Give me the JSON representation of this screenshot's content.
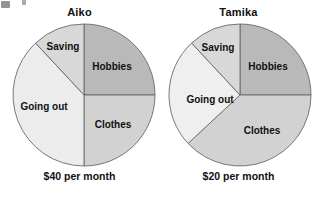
{
  "figure": {
    "title": "",
    "background_color": "#ffffff",
    "text_color": "#111111"
  },
  "charts": [
    {
      "id": "aiko",
      "title": "Aiko",
      "caption": "$40 per month",
      "center": {
        "x": 84,
        "y": 95
      },
      "radius": 71,
      "slices": [
        {
          "label": "Hobbies",
          "percent": 25,
          "color": "#b9b9b9",
          "start_deg": 0,
          "end_deg": 90,
          "label_x": 112,
          "label_y": 67
        },
        {
          "label": "Clothes",
          "percent": 25,
          "color": "#d2d2d2",
          "start_deg": 90,
          "end_deg": 180,
          "label_x": 113,
          "label_y": 125
        },
        {
          "label": "Going out",
          "percent": 38,
          "color": "#ececec",
          "start_deg": 180,
          "end_deg": 317,
          "label_x": 44,
          "label_y": 107
        },
        {
          "label": "Saving",
          "percent": 12,
          "color": "#d8d8d8",
          "start_deg": 317,
          "end_deg": 360,
          "label_x": 63,
          "label_y": 47
        }
      ]
    },
    {
      "id": "tamika",
      "title": "Tamika",
      "caption": "$20 per month",
      "center": {
        "x": 240,
        "y": 95
      },
      "radius": 71,
      "slices": [
        {
          "label": "Hobbies",
          "percent": 25,
          "color": "#b9b9b9",
          "start_deg": 0,
          "end_deg": 90,
          "label_x": 268,
          "label_y": 67
        },
        {
          "label": "Clothes",
          "percent": 38,
          "color": "#d2d2d2",
          "start_deg": 90,
          "end_deg": 227,
          "label_x": 262,
          "label_y": 131
        },
        {
          "label": "Going out",
          "percent": 25,
          "color": "#efefef",
          "start_deg": 227,
          "end_deg": 317,
          "label_x": 210,
          "label_y": 100
        },
        {
          "label": "Saving",
          "percent": 12,
          "color": "#d8d8d8",
          "start_deg": 317,
          "end_deg": 360,
          "label_x": 218,
          "label_y": 48
        }
      ]
    }
  ],
  "chart_data": {
    "type": "pie",
    "charts": [
      {
        "name": "Aiko",
        "total_label": "$40 per month",
        "total_amount": 40,
        "currency": "$",
        "period": "per month",
        "categories": [
          "Hobbies",
          "Clothes",
          "Going out",
          "Saving"
        ],
        "values": [
          25,
          25,
          38,
          12
        ],
        "value_unit": "percent",
        "amounts": [
          10,
          10,
          15,
          5
        ],
        "colors": [
          "#b9b9b9",
          "#d2d2d2",
          "#ececec",
          "#d8d8d8"
        ]
      },
      {
        "name": "Tamika",
        "total_label": "$20 per month",
        "total_amount": 20,
        "currency": "$",
        "period": "per month",
        "categories": [
          "Hobbies",
          "Clothes",
          "Going out",
          "Saving"
        ],
        "values": [
          25,
          38,
          25,
          12
        ],
        "value_unit": "percent",
        "amounts": [
          5,
          7.5,
          5,
          2.5
        ],
        "colors": [
          "#b9b9b9",
          "#d2d2d2",
          "#efefef",
          "#d8d8d8"
        ]
      }
    ],
    "legend": "none",
    "grid": false,
    "labels_inside_slices": true
  }
}
